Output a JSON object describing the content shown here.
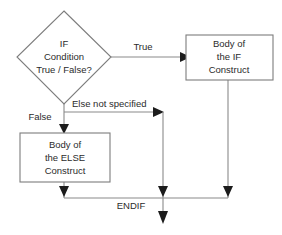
{
  "diagram": {
    "colors": {
      "background": "#ffffff",
      "shape_stroke": "#7d7d7d",
      "connector": "#8a8a8a",
      "arrow_head": "#1c1c1c",
      "text": "#2b2b2b"
    },
    "decision": {
      "name": "if-condition-decision",
      "line1": "IF",
      "line2": "Condition",
      "line3": "True / False?"
    },
    "if_body": {
      "name": "if-construct-box",
      "line1": "Body of",
      "line2": "the IF",
      "line3": "Construct"
    },
    "else_body": {
      "name": "else-construct-box",
      "line1": "Body of",
      "line2": "the ELSE",
      "line3": "Construct"
    },
    "labels": {
      "true_branch": "True",
      "false_branch": "False",
      "else_not_specified": "Else not specified",
      "endif": "ENDIF"
    }
  }
}
